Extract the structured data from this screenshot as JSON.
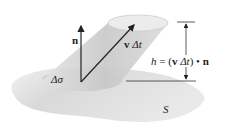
{
  "diagram": {
    "labels": {
      "normal": "n",
      "velocity": "v",
      "delta_t": "Δt",
      "delta_sigma": "Δσ",
      "surface": "S",
      "height_h": "h",
      "height_eq": "=",
      "height_open": "(",
      "height_v": "v",
      "height_dt": "Δt",
      "height_close": ")",
      "height_dot": "•",
      "height_n": "n"
    },
    "colors": {
      "surface": "#dcdcdc",
      "cylinder": "#cfcfcf",
      "cylinder_top": "#e8e8e8",
      "base_patch": "#c8c8c8",
      "arrow": "#222222"
    }
  }
}
